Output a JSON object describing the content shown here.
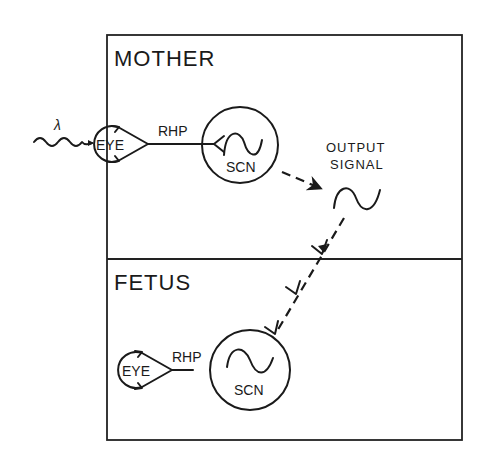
{
  "diagram": {
    "mother": {
      "label": "MOTHER",
      "light_symbol": "λ",
      "eye_label": "EYE",
      "pathway_label": "RHP",
      "scn_label": "SCN"
    },
    "output": {
      "line1": "OUTPUT",
      "line2": "SIGNAL"
    },
    "fetus": {
      "label": "FETUS",
      "eye_label": "EYE",
      "pathway_label": "RHP",
      "scn_label": "SCN"
    },
    "colors": {
      "ink": "#1a1a1a",
      "background": "#ffffff"
    }
  }
}
